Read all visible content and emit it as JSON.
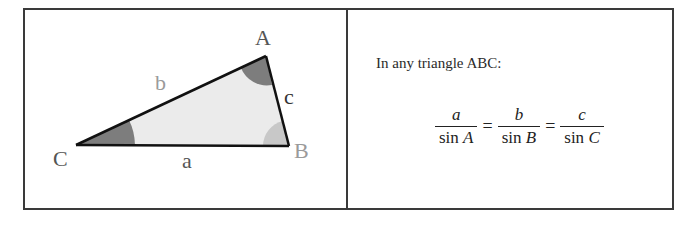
{
  "diagram": {
    "vertices": {
      "A": "A",
      "B": "B",
      "C": "C"
    },
    "sides": {
      "a": "a",
      "b": "b",
      "c": "c"
    },
    "colors": {
      "fill": "#ebebeb",
      "edge": "#111111",
      "angle_dark": "#7d7d7d",
      "angle_light": "#c8c8c8",
      "label_dark": "#555555",
      "label_light": "#9a9a9a",
      "frame": "#3a3a3a"
    }
  },
  "panel": {
    "intro": "In any triangle ABC:",
    "formula": {
      "terms": [
        {
          "num": "a",
          "den_fn": "sin",
          "den_var": "A"
        },
        {
          "num": "b",
          "den_fn": "sin",
          "den_var": "B"
        },
        {
          "num": "c",
          "den_fn": "sin",
          "den_var": "C"
        }
      ],
      "equals": "="
    }
  }
}
